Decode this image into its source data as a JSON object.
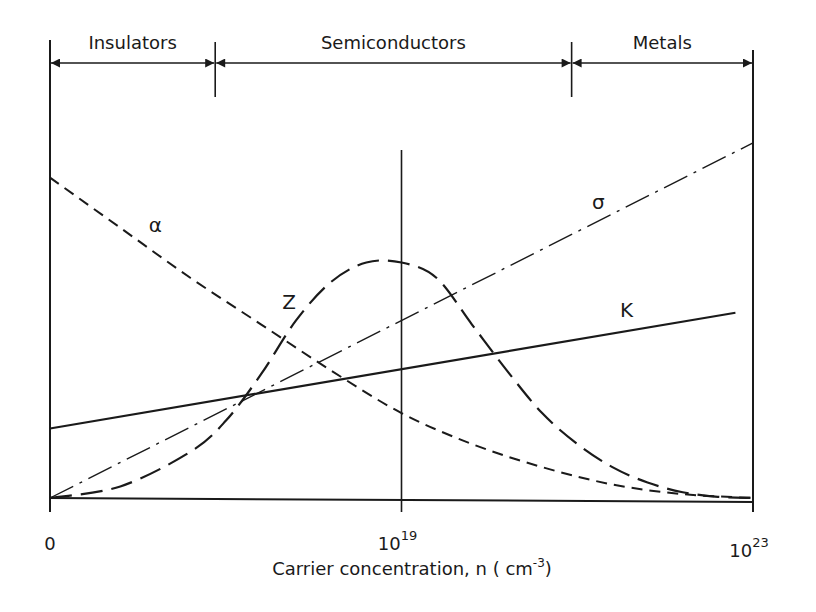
{
  "chart_data": {
    "type": "line",
    "title": "",
    "xlabel": "Carrier concentration, n ( cm",
    "xlabel_superscript": "-3",
    "xlabel_suffix": ")",
    "ylabel": "",
    "x_scale": "normalized position along carrier-concentration axis (0 = 0, 0.5 = 10^19, 1 = 10^23)",
    "y_scale": "relative magnitude (0 = baseline, 1 = top of axis)",
    "xlim": [
      0,
      1
    ],
    "ylim": [
      0,
      1
    ],
    "grid": false,
    "x_ticks": [
      {
        "pos": 0.0,
        "base": "0",
        "exp": ""
      },
      {
        "pos": 0.5,
        "base": "10",
        "exp": "19"
      },
      {
        "pos": 1.0,
        "base": "10",
        "exp": "23"
      }
    ],
    "regions": [
      {
        "name": "Insulators",
        "from": 0.0,
        "to": 0.235
      },
      {
        "name": "Semiconductors",
        "from": 0.235,
        "to": 0.742
      },
      {
        "name": "Metals",
        "from": 0.742,
        "to": 1.0
      }
    ],
    "reference_line": {
      "x": 0.5,
      "label": "10^19"
    },
    "series": [
      {
        "name": "σ",
        "label": "σ",
        "style": "dash-dot",
        "x": [
          0.0,
          1.0
        ],
        "y": [
          0.0,
          0.92
        ],
        "label_pos": [
          0.78,
          0.75
        ]
      },
      {
        "name": "K",
        "label": "K",
        "style": "solid",
        "x": [
          0.0,
          0.975
        ],
        "y": [
          0.18,
          0.48
        ],
        "label_pos": [
          0.82,
          0.47
        ]
      },
      {
        "name": "α",
        "label": "α",
        "style": "short-dash",
        "x": [
          0.0,
          0.1,
          0.2,
          0.3,
          0.4,
          0.5,
          0.6,
          0.7,
          0.8,
          0.9,
          1.0
        ],
        "y": [
          0.83,
          0.7,
          0.57,
          0.45,
          0.33,
          0.22,
          0.14,
          0.08,
          0.035,
          0.01,
          0.0
        ],
        "label_pos": [
          0.15,
          0.69
        ]
      },
      {
        "name": "Z",
        "label": "Z",
        "style": "long-dash",
        "x": [
          0.0,
          0.1,
          0.2,
          0.25,
          0.3,
          0.35,
          0.4,
          0.45,
          0.5,
          0.55,
          0.6,
          0.65,
          0.7,
          0.75,
          0.8,
          0.85,
          0.9,
          0.95,
          1.0
        ],
        "y": [
          0.0,
          0.03,
          0.12,
          0.2,
          0.32,
          0.46,
          0.56,
          0.61,
          0.61,
          0.57,
          0.45,
          0.33,
          0.22,
          0.14,
          0.08,
          0.04,
          0.015,
          0.003,
          0.0
        ],
        "label_pos": [
          0.34,
          0.49
        ]
      }
    ]
  }
}
